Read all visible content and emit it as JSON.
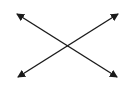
{
  "diagram": {
    "type": "crossing-double-arrows",
    "stroke_color": "#1a1a1a",
    "background": "#ffffff",
    "arrows": [
      {
        "name": "diagonal-top-left-to-bottom-right",
        "x1": 17,
        "y1": 14,
        "x2": 117,
        "y2": 77,
        "heads": "both"
      },
      {
        "name": "diagonal-bottom-left-to-top-right",
        "x1": 18,
        "y1": 77,
        "x2": 118,
        "y2": 14,
        "heads": "both"
      }
    ]
  }
}
